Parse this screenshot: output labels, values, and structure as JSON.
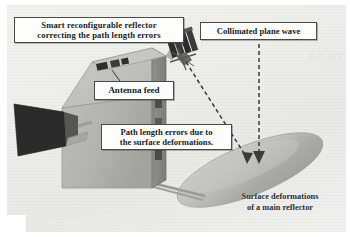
{
  "figure": {
    "background_color": "#eeeeec",
    "page_color": "#ffffff"
  },
  "callouts": {
    "smart_reflector": {
      "line1": "Smart reconfigurable reflector",
      "line2": "correcting the path length errors"
    },
    "plane_wave": {
      "line1": "Collimated plane wave"
    },
    "antenna_feed": {
      "line1": "Antenna feed"
    },
    "path_errors": {
      "line1": "Path length errors due to",
      "line2": "the surface deformations."
    }
  },
  "captions": {
    "surface_deformations": {
      "line1": "Surface deformations",
      "line2": "of a main reflector"
    }
  },
  "artwork": {
    "spacecraft_body_color": "#b4b4b0",
    "spacecraft_body_shadow_color": "#8e8e8a",
    "horn_antenna_color": "#2b2b2b",
    "smart_reflector_panel_color": "#343434",
    "main_reflector_color": "#b9b9b5",
    "main_reflector_highlight": "#d8d8d4",
    "strut_color": "#a0a09c",
    "arrow_color": "#3a3a3a"
  },
  "bleed_through": {
    "right_text": "JTE SA",
    "bottom_text": "reflected page text",
    "left_text": "ir"
  }
}
